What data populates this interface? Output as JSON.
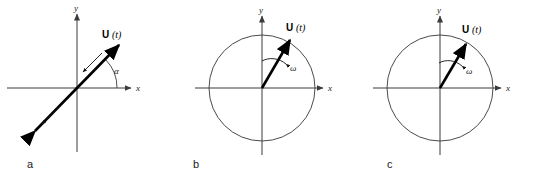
{
  "figure": {
    "background": "#ffffff",
    "width": 534,
    "height": 178
  },
  "panels": [
    {
      "letter": "a",
      "type": "linear-polarization",
      "has_circle": false,
      "axis_x_label": "x",
      "axis_y_label": "y",
      "vector_label_symbol": "U",
      "vector_label_arg": "(t)",
      "angle_label": "α",
      "omega_label": "",
      "vector_heads": "double",
      "vector_angle_deg": 42,
      "motion_arrows": 2
    },
    {
      "letter": "b",
      "type": "circular-polarization",
      "has_circle": true,
      "axis_x_label": "x",
      "axis_y_label": "y",
      "vector_label_symbol": "U",
      "vector_label_arg": "(t)",
      "angle_label": "",
      "omega_label": "ω",
      "vector_heads": "single",
      "vector_angle_deg": 70,
      "motion_arrows": 1
    },
    {
      "letter": "c",
      "type": "elliptical-polarization",
      "has_circle": true,
      "axis_x_label": "x",
      "axis_y_label": "y",
      "vector_label_symbol": "U",
      "vector_label_arg": "(t)",
      "angle_label": "",
      "omega_label": "ω",
      "vector_heads": "single",
      "vector_angle_deg": 70,
      "motion_arrows": 1
    }
  ],
  "colors": {
    "vector": "#000000",
    "axis": "#3b3b3b",
    "circle": "#4a4a4a",
    "text": "#1a1a1a"
  }
}
